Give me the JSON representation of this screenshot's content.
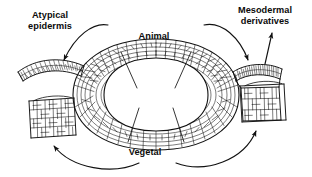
{
  "figure": {
    "background_color": "#ffffff",
    "ink_color": "#111111",
    "width": 312,
    "height": 177
  },
  "labels": {
    "atypical_epidermis": "Atypical\nepidermis",
    "atypical_epidermis_line1": "Atypical",
    "atypical_epidermis_line2": "epidermis",
    "animal": "Animal",
    "mesodermal_line1": "Mesodermal",
    "mesodermal_line2": "derivatives",
    "vegetal": "Vegetal"
  },
  "structures": {
    "embryo": {
      "name": "blastula",
      "pole_top": "Animal",
      "pole_bottom": "Vegetal",
      "description": "oval embryo with thick polygonal cell wall and central blastocoel cavity"
    },
    "explants": [
      {
        "id": "explant-animal-cap",
        "name": "atypical-epidermis-explant",
        "description": "thin curved arc of small cells",
        "position": "upper-left"
      },
      {
        "id": "explant-vegetal",
        "name": "vegetal-endoderm-explant",
        "description": "block of large polygonal cells",
        "position": "lower-left"
      },
      {
        "id": "explant-marginal",
        "name": "marginal-zone-explant",
        "description": "small-celled arc atop a block of large cells",
        "position": "upper-right"
      },
      {
        "id": "explant-mesoderm",
        "name": "mesodermal-explant",
        "description": "block of large polygonal cells",
        "position": "lower-right"
      }
    ]
  },
  "arrows": [
    {
      "id": "arrow-animal-to-epidermis",
      "from": "embryo-animal-pole",
      "to": "atypical-epidermis-explant",
      "style": "curved"
    },
    {
      "id": "arrow-animal-to-marginal",
      "from": "embryo-animal-pole",
      "to": "marginal-zone-explant",
      "style": "curved"
    },
    {
      "id": "arrow-vegetal-to-endoderm",
      "from": "embryo-vegetal-pole",
      "to": "vegetal-endoderm-explant",
      "style": "curved"
    },
    {
      "id": "arrow-vegetal-to-mesoderm",
      "from": "embryo-vegetal-pole",
      "to": "mesodermal-explant",
      "style": "curved"
    },
    {
      "id": "arrow-marginal-to-label",
      "from": "marginal-zone-explant",
      "to": "mesodermal-derivatives-label",
      "style": "straight"
    }
  ]
}
